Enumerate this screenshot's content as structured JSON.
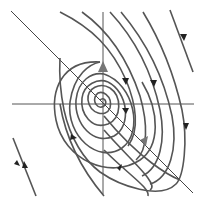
{
  "diagram": {
    "type": "phase-portrait",
    "colors": {
      "background": "#ffffff",
      "trajectory": "#555555",
      "arrow": "#222222",
      "eigen_arrow": "#777777",
      "axis": "#555555"
    },
    "axes": {
      "horizontal": {
        "x1": 12,
        "y1": 104,
        "x2": 194,
        "y2": 104
      },
      "vertical": {
        "x1": 103,
        "y1": 12,
        "x2": 103,
        "y2": 194
      }
    },
    "eigen_line": {
      "x1": 11,
      "y1": 11,
      "x2": 193,
      "y2": 193
    },
    "equilibrium": {
      "x": 100,
      "y": 100
    }
  }
}
